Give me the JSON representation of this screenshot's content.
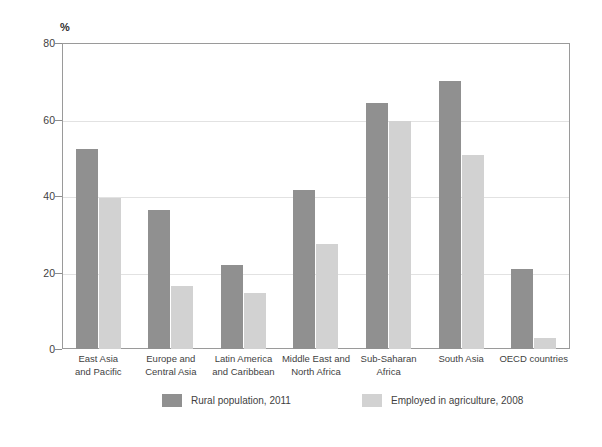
{
  "chart_data": {
    "type": "bar",
    "title": "",
    "subtitle": "",
    "xlabel": "",
    "ylabel": "%",
    "ylim": [
      0,
      80
    ],
    "yticks": [
      0,
      20,
      40,
      60,
      80
    ],
    "ytick_labels": [
      "0",
      "20",
      "40",
      "60",
      "80"
    ],
    "grid": "horizontal",
    "legend_position": "bottom",
    "categories": [
      "East Asia\nand Pacific",
      "Europe and\nCentral Asia",
      "Latin America\nand Caribbean",
      "Middle East and\nNorth Africa",
      "Sub-Saharan\nAfrica",
      "South Asia",
      "OECD countries"
    ],
    "category_lines": [
      [
        "East Asia",
        "and Pacific"
      ],
      [
        "Europe and",
        "Central Asia"
      ],
      [
        "Latin America",
        "and Caribbean"
      ],
      [
        "Middle East and",
        "North Africa"
      ],
      [
        "Sub-Saharan",
        "Africa"
      ],
      [
        "South Asia",
        ""
      ],
      [
        "OECD countries",
        ""
      ]
    ],
    "series": [
      {
        "name": "Rural population, 2011",
        "color": "#909090",
        "values": [
          52.3,
          36.3,
          21.9,
          41.7,
          64.2,
          70.2,
          20.9
        ]
      },
      {
        "name": "Employed in agriculture, 2008",
        "color": "#d2d2d2",
        "values": [
          39.4,
          16.6,
          14.6,
          27.5,
          59.6,
          50.6,
          2.9
        ]
      }
    ]
  },
  "axis": {
    "y_title": "%"
  },
  "colors": {
    "series0": "#909090",
    "series1": "#d2d2d2",
    "gridline": "#e2e2e2",
    "frame": "#9a9a9a",
    "text": "#3f3f3f",
    "background": "#ffffff"
  }
}
